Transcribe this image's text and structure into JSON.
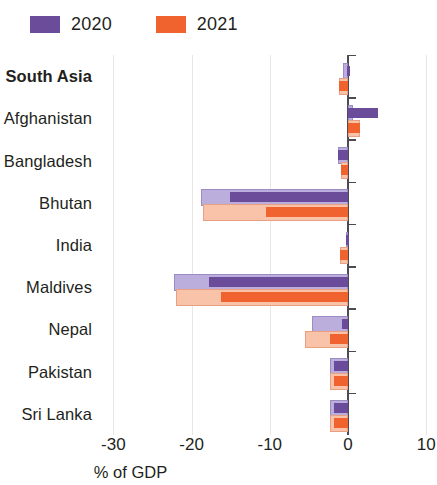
{
  "legend": {
    "entries": [
      {
        "label": "2020",
        "color": "#6B4C9A",
        "name": "legend-swatch-2020"
      },
      {
        "label": "2021",
        "color": "#F0622E",
        "name": "legend-swatch-2021"
      }
    ]
  },
  "axis": {
    "x_title": "% of GDP",
    "x_ticks": [
      "-30",
      "-20",
      "-10",
      "0",
      "10"
    ],
    "x_tick_values": [
      -30,
      -20,
      -10,
      0,
      10
    ]
  },
  "colors": {
    "series_2020_dark": "#6B4C9A",
    "series_2020_light": "#BCAEDC",
    "series_2021_dark": "#F0622E",
    "series_2021_light": "#F8C3A8",
    "axis": "#4f4a52",
    "grid": "#e9e6e4",
    "text": "#231f20"
  },
  "categories": [
    {
      "label": "South Asia",
      "bold": true
    },
    {
      "label": "Afghanistan",
      "bold": false
    },
    {
      "label": "Bangladesh",
      "bold": false
    },
    {
      "label": "Bhutan",
      "bold": false
    },
    {
      "label": "India",
      "bold": false
    },
    {
      "label": "Maldives",
      "bold": false
    },
    {
      "label": "Nepal",
      "bold": false
    },
    {
      "label": "Pakistan",
      "bold": false
    },
    {
      "label": "Sri Lanka",
      "bold": false
    }
  ],
  "chart_data": {
    "type": "bar",
    "orientation": "horizontal",
    "title": "",
    "xlabel": "% of GDP",
    "ylabel": "",
    "xlim": [
      -33,
      11
    ],
    "xticks": [
      -30,
      -20,
      -10,
      0,
      10
    ],
    "grid": true,
    "legend_position": "top-left",
    "categories": [
      "South Asia",
      "Afghanistan",
      "Bangladesh",
      "Bhutan",
      "India",
      "Maldives",
      "Nepal",
      "Pakistan",
      "Sri Lanka"
    ],
    "note": "Each category shows two overlaid bars per year: a pale wide bar (outer/total) and a darker narrow bar (inner) drawn on top.",
    "series": [
      {
        "name": "2020",
        "color": "#6B4C9A",
        "light_color": "#BCAEDC",
        "values": [
          -0.1,
          3.9,
          -1.3,
          -15.1,
          -0.2,
          -17.8,
          -0.8,
          -1.8,
          -1.8
        ],
        "outer_values": [
          -0.6,
          0.7,
          -1.3,
          -18.8,
          -0.2,
          -22.3,
          -4.6,
          -2.3,
          -2.3
        ]
      },
      {
        "name": "2021",
        "color": "#F0622E",
        "light_color": "#F8C3A8",
        "values": [
          -1.1,
          1.5,
          -0.9,
          -10.5,
          -1.0,
          -16.3,
          -2.3,
          -1.8,
          -1.8
        ],
        "outer_values": [
          -1.1,
          1.5,
          -0.9,
          -18.5,
          -1.0,
          -22.0,
          -5.5,
          -2.3,
          -2.3
        ]
      }
    ]
  }
}
